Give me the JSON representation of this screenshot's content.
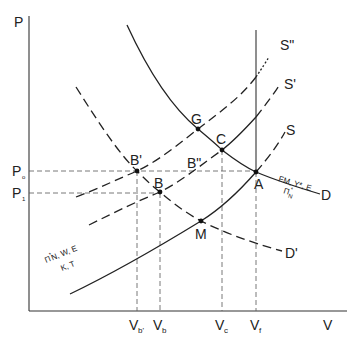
{
  "axes": {
    "y_label": "P",
    "x_label": "V"
  },
  "y_ticks": [
    {
      "id": "P0",
      "main": "P",
      "sub": "o"
    },
    {
      "id": "P1",
      "main": "P",
      "sub": "1"
    }
  ],
  "x_ticks": [
    {
      "id": "Vb_prime",
      "main": "V",
      "sub": "b'"
    },
    {
      "id": "Vb",
      "main": "V",
      "sub": "b"
    },
    {
      "id": "Vc",
      "main": "V",
      "sub": "c"
    },
    {
      "id": "Vf",
      "main": "V",
      "sub": "f"
    }
  ],
  "curves": {
    "S": "S",
    "S_prime": "S'",
    "S_double_prime": "S\"",
    "D": "D",
    "D_prime": "D'"
  },
  "points": {
    "A": "A",
    "B": "B",
    "B_prime": "B'",
    "B_double_prime": "B\"",
    "C": "C",
    "G": "G",
    "M": "M"
  },
  "annotations": {
    "demand_top": "FM, Y*, E",
    "demand_bottom_main": "Π",
    "demand_bottom_sub": "N",
    "demand_bottom_sup": "*",
    "supply_top_main": "Π",
    "supply_top_sup": "*",
    "supply_top_rest": "N, W, E",
    "supply_bottom": "K, T"
  }
}
